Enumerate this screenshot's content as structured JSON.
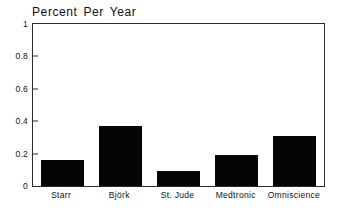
{
  "chart_data": {
    "type": "bar",
    "title": "Percent Per Year",
    "xlabel": "",
    "ylabel": "",
    "categories": [
      "Starr",
      "Björk",
      "St. Jude",
      "Medtronic",
      "Omniscience"
    ],
    "values": [
      0.16,
      0.37,
      0.09,
      0.19,
      0.31
    ],
    "ylim": [
      0,
      1
    ],
    "yticks": [
      0,
      0.2,
      0.4,
      0.6,
      0.8,
      1
    ],
    "ytick_labels": [
      "0",
      "0.2",
      "0.4",
      "0.6",
      "0.8",
      "1"
    ],
    "grid": false,
    "legend": "none",
    "bar_color": "#050505",
    "axis_color": "#2b2b2b",
    "background_color": "#ffffff"
  }
}
